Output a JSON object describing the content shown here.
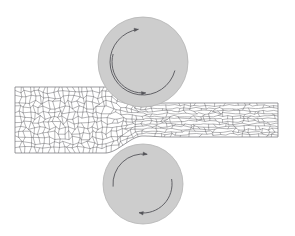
{
  "figure": {
    "background_color": "#ffffff",
    "width": 295,
    "height": 236
  },
  "rolls": [
    {
      "name": "top-roll",
      "label": "Upper work roll",
      "cx": 143,
      "cy": 62,
      "r": 45,
      "fill_color": "#cdcdcd",
      "stroke_color": "#b4b4b4",
      "rotation": "clockwise",
      "arrows": [
        {
          "name": "top-roll-arrow-left",
          "start_angle": 285,
          "end_angle": 175,
          "radius": 31,
          "arrowhead_at": "end",
          "color": "#55555a"
        },
        {
          "name": "top-roll-arrow-right",
          "start_angle": 105,
          "end_angle": 352,
          "radius": 33,
          "arrowhead_at": "end",
          "color": "#55555a"
        }
      ]
    },
    {
      "name": "bottom-roll",
      "label": "Lower work roll",
      "cx": 143,
      "cy": 184,
      "r": 40,
      "fill_color": "#cdcdcd",
      "stroke_color": "#b4b4b4",
      "rotation": "counter-clockwise",
      "arrows": [
        {
          "name": "bottom-roll-arrow-left",
          "start_angle": 80,
          "end_angle": 188,
          "radius": 29,
          "arrowhead_at": "end",
          "color": "#55555a"
        },
        {
          "name": "bottom-roll-arrow-right",
          "start_angle": 265,
          "end_angle": 8,
          "radius": 30,
          "arrowhead_at": "end",
          "color": "#55555a"
        }
      ]
    }
  ],
  "workpiece": {
    "name": "rolled-strip",
    "label": "Metal strip",
    "grain_line_color": "#6e6e72",
    "fill_color": "#ffffff",
    "entry": {
      "label": "Undeformed equiaxed grains",
      "x_start": 15,
      "x_end": 105,
      "top_y": 89,
      "bottom_y": 155,
      "thickness": 66,
      "grain_shape": "equiaxed",
      "grain_size": 8.5
    },
    "deformation_zone": {
      "label": "Roll bite / deformation zone",
      "x_start": 105,
      "x_end": 168,
      "grain_shape": "transitional"
    },
    "exit": {
      "label": "Elongated pancaked grains",
      "x_start": 168,
      "x_end": 278,
      "top_y": 103,
      "bottom_y": 137,
      "thickness": 34,
      "grain_shape": "elongated",
      "grain_size": 6.0
    },
    "reduction_percent": 48
  },
  "geometry": {
    "neck_x": 143,
    "neck_half_thickness": 16,
    "entry_half_thickness": 33,
    "exit_half_thickness": 17,
    "centerline_y": 120
  }
}
